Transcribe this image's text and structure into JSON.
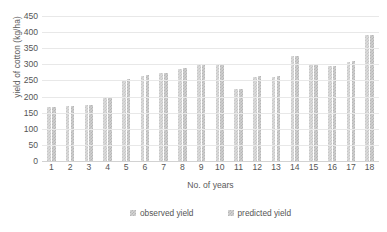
{
  "chart_data": {
    "type": "bar",
    "title": "",
    "xlabel": "No. of years",
    "ylabel": "yield of cotton (kg/ha)",
    "categories": [
      "1",
      "2",
      "3",
      "4",
      "5",
      "6",
      "7",
      "8",
      "9",
      "10",
      "11",
      "12",
      "13",
      "14",
      "15",
      "16",
      "17",
      "18"
    ],
    "series": [
      {
        "name": "observed yield",
        "values": [
          168,
          170,
          174,
          196,
          252,
          265,
          272,
          287,
          297,
          298,
          223,
          261,
          261,
          326,
          300,
          294,
          308,
          391
        ]
      },
      {
        "name": "predicted yield",
        "values": [
          168,
          171,
          175,
          198,
          253,
          267,
          274,
          289,
          299,
          300,
          224,
          263,
          263,
          327,
          301,
          295,
          310,
          392
        ]
      }
    ],
    "ylim": [
      0,
      450
    ],
    "yticks": [
      0,
      50,
      100,
      150,
      200,
      250,
      300,
      350,
      400,
      450
    ],
    "ytick_labels": [
      "0",
      "50",
      "100",
      "150",
      "200",
      "250",
      "300",
      "350",
      "400",
      "450"
    ],
    "grid": true,
    "legend_position": "bottom",
    "legend_entries": [
      "observed yield",
      "predicted yield"
    ]
  }
}
